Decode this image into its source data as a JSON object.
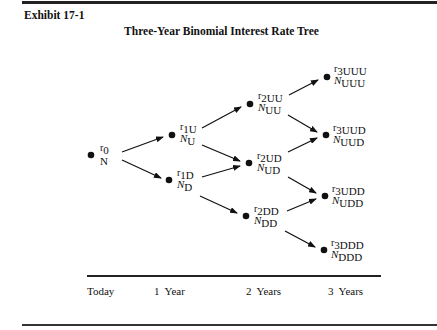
{
  "exhibit": {
    "label": "Exhibit 17-1"
  },
  "title": "Three-Year Binomial Interest Rate Tree",
  "nodes": {
    "r0": {
      "r_symbol": "r",
      "r_sub": "0",
      "n_symbol": "N",
      "n_sub": ""
    },
    "r1U": {
      "r_symbol": "r",
      "r_sub": "1U",
      "n_symbol": "N",
      "n_sub": "U"
    },
    "r1D": {
      "r_symbol": "r",
      "r_sub": "1D",
      "n_symbol": "N",
      "n_sub": "D"
    },
    "r2UU": {
      "r_symbol": "r",
      "r_sub": "2UU",
      "n_symbol": "N",
      "n_sub": "UU"
    },
    "r2UD": {
      "r_symbol": "r",
      "r_sub": "2UD",
      "n_symbol": "N",
      "n_sub": "UD"
    },
    "r2DD": {
      "r_symbol": "r",
      "r_sub": "2DD",
      "n_symbol": "N",
      "n_sub": "DD"
    },
    "r3UUU": {
      "r_symbol": "r",
      "r_sub": "3UUU",
      "n_symbol": "N",
      "n_sub": "UUU"
    },
    "r3UUD": {
      "r_symbol": "r",
      "r_sub": "3UUD",
      "n_symbol": "N",
      "n_sub": "UUD"
    },
    "r3UDD": {
      "r_symbol": "r",
      "r_sub": "3UDD",
      "n_symbol": "N",
      "n_sub": "UDD"
    },
    "r3DDD": {
      "r_symbol": "r",
      "r_sub": "3DDD",
      "n_symbol": "N",
      "n_sub": "DDD"
    }
  },
  "axis": {
    "labels": [
      "Today",
      "1  Year",
      "2  Years",
      "3  Years"
    ]
  },
  "colors": {
    "ink": "#111111",
    "background": "#ffffff"
  }
}
